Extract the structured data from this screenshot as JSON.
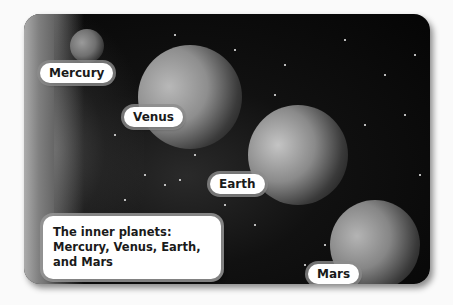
{
  "figure": {
    "caption": "The inner planets: Mercury, Venus, Earth, and Mars",
    "planets": [
      {
        "name": "Mercury"
      },
      {
        "name": "Venus"
      },
      {
        "name": "Earth"
      },
      {
        "name": "Mars"
      }
    ]
  }
}
